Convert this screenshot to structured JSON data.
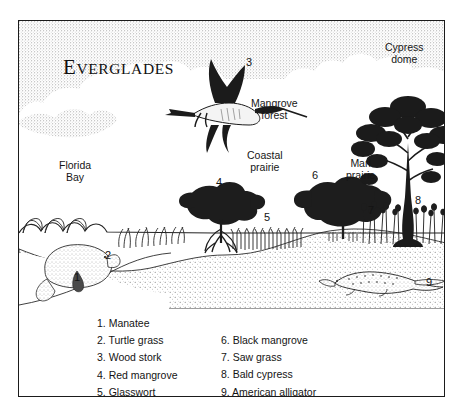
{
  "figure": {
    "title": "Everglades",
    "title_initial": "E",
    "title_rest": "VERGLADES"
  },
  "scene_labels": [
    {
      "id": "florida-bay",
      "text": "Florida\nBay",
      "x": 40,
      "y": 138
    },
    {
      "id": "mangrove-forest",
      "text": "Mangrove\nforest",
      "x": 232,
      "y": 76
    },
    {
      "id": "coastal-prairie",
      "text": "Coastal\nprairie",
      "x": 228,
      "y": 128
    },
    {
      "id": "marl-prairie",
      "text": "Marl\nprairie",
      "x": 327,
      "y": 136
    },
    {
      "id": "cypress-dome",
      "text": "Cypress\ndome",
      "x": 366,
      "y": 20
    }
  ],
  "callouts": [
    {
      "id": "callout-1",
      "number": "1",
      "x": 55,
      "y": 250
    },
    {
      "id": "callout-2",
      "number": "2",
      "x": 86,
      "y": 228
    },
    {
      "id": "callout-3",
      "number": "3",
      "x": 227,
      "y": 35
    },
    {
      "id": "callout-4",
      "number": "4",
      "x": 197,
      "y": 155
    },
    {
      "id": "callout-5",
      "number": "5",
      "x": 245,
      "y": 190
    },
    {
      "id": "callout-6",
      "number": "6",
      "x": 293,
      "y": 148
    },
    {
      "id": "callout-7",
      "number": "7",
      "x": 349,
      "y": 183
    },
    {
      "id": "callout-8",
      "number": "8",
      "x": 396,
      "y": 173
    },
    {
      "id": "callout-9",
      "number": "9",
      "x": 407,
      "y": 255
    }
  ],
  "legend": {
    "left_column": [
      "1. Manatee",
      "2. Turtle grass",
      "3. Wood stork",
      "4. Red mangrove",
      "5. Glasswort"
    ],
    "right_column": [
      "6. Black mangrove",
      "7. Saw grass",
      "8. Bald cypress",
      "9. American alligator"
    ]
  },
  "colors": {
    "ink": "#141414",
    "border": "#1b1b1b",
    "paper": "#ffffff",
    "stipple": "#8d8d8d"
  }
}
